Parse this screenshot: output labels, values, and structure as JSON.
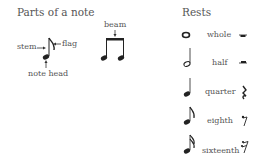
{
  "left": {
    "title": "Parts of a note",
    "labels": {
      "stem": "stem",
      "flag": "flag",
      "note_head": "note head",
      "beam": "beam"
    }
  },
  "right": {
    "title": "Rests",
    "rows": [
      {
        "name": "whole",
        "note_icon": "whole-note-icon",
        "rest_icon": "whole-rest-icon"
      },
      {
        "name": "half",
        "note_icon": "half-note-icon",
        "rest_icon": "half-rest-icon"
      },
      {
        "name": "quarter",
        "note_icon": "quarter-note-icon",
        "rest_icon": "quarter-rest-icon"
      },
      {
        "name": "eighth",
        "note_icon": "eighth-note-icon",
        "rest_icon": "eighth-rest-icon"
      },
      {
        "name": "sixteenth",
        "note_icon": "sixteenth-note-icon",
        "rest_icon": "sixteenth-rest-icon"
      }
    ]
  }
}
